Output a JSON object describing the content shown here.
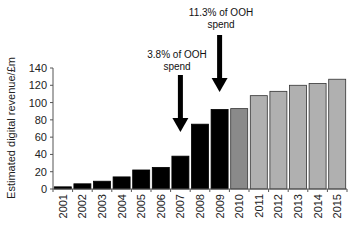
{
  "chart_data": {
    "type": "bar",
    "title": "",
    "xlabel": "",
    "ylabel": "Estimated digital revenue/£m",
    "ylim": [
      0,
      140
    ],
    "yticks": [
      0,
      20,
      40,
      60,
      80,
      100,
      120,
      140
    ],
    "grid": false,
    "categories": [
      "2001",
      "2002",
      "2003",
      "2004",
      "2005",
      "2006",
      "2007",
      "2008",
      "2009",
      "2010",
      "2011",
      "2012",
      "2013",
      "2014",
      "2015"
    ],
    "values": [
      2.5,
      6,
      9,
      14,
      22,
      25,
      38,
      75,
      92,
      93,
      108,
      113,
      120,
      122,
      127
    ],
    "bar_colors": [
      "#000000",
      "#000000",
      "#000000",
      "#000000",
      "#000000",
      "#000000",
      "#000000",
      "#000000",
      "#000000",
      "#8a8a8a",
      "#b0b0b0",
      "#b0b0b0",
      "#b0b0b0",
      "#b0b0b0",
      "#b0b0b0"
    ],
    "annotations": [
      {
        "category": "2007",
        "line1": "3.8% of OOH",
        "line2": "spend"
      },
      {
        "category": "2009",
        "line1": "11.3% of OOH",
        "line2": "spend"
      }
    ]
  },
  "colors": {
    "actual": "#000000",
    "transition": "#8a8a8a",
    "forecast": "#b0b0b0",
    "axis": "#555555"
  }
}
